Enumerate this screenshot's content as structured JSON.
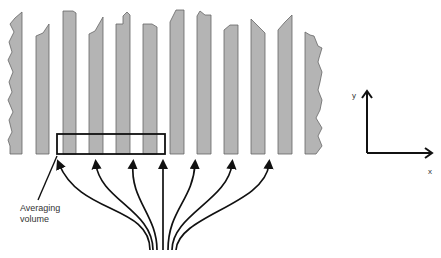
{
  "figure": {
    "panel_letter": "",
    "annotation": {
      "line1": "Averaging",
      "line2": "volume"
    },
    "axes": {
      "y_label": "y",
      "x_label": "x"
    },
    "colors": {
      "bar_fill": "#b4b4b4",
      "bar_edge": "#555555",
      "line": "#111111"
    },
    "bar_count": 11,
    "arrow_count": 8
  }
}
